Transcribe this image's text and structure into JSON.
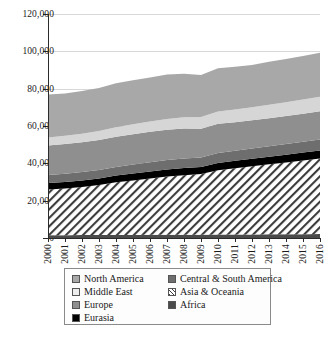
{
  "chart_data": {
    "type": "area",
    "stacked": true,
    "title": "",
    "xlabel": "",
    "ylabel": "",
    "grid": true,
    "legend_position": "bottom",
    "x": [
      2000,
      2001,
      2002,
      2003,
      2004,
      2005,
      2006,
      2007,
      2008,
      2009,
      2010,
      2011,
      2012,
      2013,
      2014,
      2015,
      2016
    ],
    "categories": [
      "2000",
      "2001",
      "2002",
      "2003",
      "2004",
      "2005",
      "2006",
      "2007",
      "2008",
      "2009",
      "2010",
      "2011",
      "2012",
      "2013",
      "2014",
      "2015",
      "2016"
    ],
    "ylim": [
      0,
      120000
    ],
    "ytick_values": [
      0,
      20000,
      40000,
      60000,
      80000,
      100000,
      120000
    ],
    "ytick_labels": [
      "0",
      "20,000",
      "40,000",
      "60,000",
      "80,000",
      "100,000",
      "120,000"
    ],
    "stack_order_bottom_to_top": [
      "Africa",
      "Asia & Oceania",
      "Eurasia",
      "Central & South America",
      "Europe",
      "Middle East",
      "North America"
    ],
    "series": [
      {
        "name": "Africa",
        "color": "#4a4a4a",
        "pattern": "solid",
        "values": [
          1500,
          1520,
          1550,
          1580,
          1620,
          1650,
          1680,
          1720,
          1760,
          1780,
          1820,
          1860,
          1900,
          1950,
          2000,
          2050,
          2100
        ]
      },
      {
        "name": "Asia & Oceania",
        "color": "#ffffff",
        "pattern": "diagonal-hatch",
        "values": [
          24500,
          25000,
          25800,
          26800,
          28200,
          29200,
          30200,
          31200,
          31800,
          32500,
          34500,
          35500,
          36500,
          37500,
          38500,
          39500,
          40500
        ]
      },
      {
        "name": "Eurasia",
        "color": "#000000",
        "pattern": "solid",
        "values": [
          3400,
          3450,
          3500,
          3550,
          3620,
          3680,
          3750,
          3820,
          3880,
          3800,
          3900,
          3980,
          4050,
          4100,
          4150,
          4200,
          4250
        ]
      },
      {
        "name": "Central & South America",
        "color": "#6e6e6e",
        "pattern": "solid",
        "values": [
          4400,
          4450,
          4480,
          4520,
          4650,
          4780,
          4900,
          5050,
          5150,
          5100,
          5300,
          5420,
          5550,
          5650,
          5750,
          5850,
          5950
        ]
      },
      {
        "name": "Europe",
        "color": "#8f8f8f",
        "pattern": "solid",
        "values": [
          15800,
          15900,
          15950,
          16050,
          16200,
          16300,
          16350,
          16200,
          16100,
          15400,
          15700,
          15300,
          15100,
          15000,
          14900,
          15000,
          15050
        ]
      },
      {
        "name": "Middle East",
        "color": "#d6d6d6",
        "pattern": "solid",
        "values": [
          4300,
          4450,
          4600,
          4800,
          5050,
          5300,
          5550,
          5800,
          6050,
          6200,
          6500,
          6750,
          7000,
          7250,
          7450,
          7650,
          7850
        ]
      },
      {
        "name": "North America",
        "color": "#a8a8a8",
        "pattern": "solid",
        "values": [
          23000,
          22600,
          22900,
          23100,
          23500,
          23600,
          23500,
          23800,
          23200,
          22500,
          23200,
          22900,
          22600,
          23000,
          23200,
          23300,
          23500
        ]
      }
    ],
    "totals": [
      76900,
      77370,
      78780,
      80400,
      83240,
      84510,
      85930,
      87590,
      87940,
      87280,
      90920,
      91710,
      92700,
      94450,
      95950,
      97550,
      99200
    ]
  },
  "legend": {
    "items": [
      {
        "label": "North America",
        "swatch": "#a8a8a8",
        "pattern": "solid"
      },
      {
        "label": "Central & South America",
        "swatch": "#6e6e6e",
        "pattern": "solid"
      },
      {
        "label": "Middle East",
        "swatch": "#ededed",
        "pattern": "solid"
      },
      {
        "label": "Asia & Oceania",
        "swatch": "#ffffff",
        "pattern": "diagonal-hatch"
      },
      {
        "label": "Europe",
        "swatch": "#8f8f8f",
        "pattern": "solid"
      },
      {
        "label": "Africa",
        "swatch": "#4a4a4a",
        "pattern": "solid"
      },
      {
        "label": "Eurasia",
        "swatch": "#000000",
        "pattern": "solid"
      }
    ]
  }
}
